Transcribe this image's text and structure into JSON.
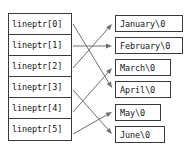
{
  "diagram": {
    "array": {
      "name": "lineptr",
      "cells": [
        {
          "label": "lineptr[0]"
        },
        {
          "label": "lineptr[1]"
        },
        {
          "label": "lineptr[2]"
        },
        {
          "label": "lineptr[3]"
        },
        {
          "label": "lineptr[4]"
        },
        {
          "label": "lineptr[5]"
        }
      ]
    },
    "strings": [
      {
        "label": "January\\0",
        "left": 115,
        "top": 15,
        "width": 68
      },
      {
        "label": "February\\0",
        "left": 115,
        "top": 37,
        "width": 68
      },
      {
        "label": "March\\0",
        "left": 115,
        "top": 59,
        "width": 56
      },
      {
        "label": "April\\0",
        "left": 115,
        "top": 81,
        "width": 56
      },
      {
        "label": "May\\0",
        "left": 115,
        "top": 104,
        "width": 46
      },
      {
        "label": "June\\0",
        "left": 115,
        "top": 126,
        "width": 50
      }
    ],
    "arrows": [
      {
        "from": "lineptr[0]",
        "to": "April\\0",
        "x1": 73,
        "y1": 24,
        "x2": 112,
        "y2": 88
      },
      {
        "from": "lineptr[1]",
        "to": "February\\0",
        "x1": 73,
        "y1": 46,
        "x2": 112,
        "y2": 46
      },
      {
        "from": "lineptr[2]",
        "to": "January\\0",
        "x1": 73,
        "y1": 68,
        "x2": 112,
        "y2": 24
      },
      {
        "from": "lineptr[3]",
        "to": "June\\0",
        "x1": 73,
        "y1": 90,
        "x2": 112,
        "y2": 134
      },
      {
        "from": "lineptr[4]",
        "to": "March\\0",
        "x1": 73,
        "y1": 112,
        "x2": 112,
        "y2": 68
      },
      {
        "from": "lineptr[5]",
        "to": "May\\0",
        "x1": 73,
        "y1": 134,
        "x2": 112,
        "y2": 112
      }
    ],
    "colors": {
      "stroke": "#6e6e6e",
      "border": "#3a3a3a",
      "text": "#161616",
      "background": "#ffffff"
    }
  }
}
